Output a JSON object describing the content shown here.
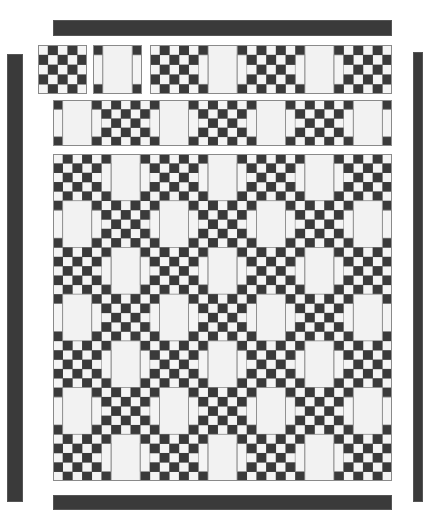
{
  "diagram": {
    "title": "",
    "type": "quilt-layout",
    "colors": {
      "dark": "#3a3a3a",
      "light": "#f4f4f4",
      "center": "#f2f2f2",
      "outline": "#8a8a8a",
      "background": "#ffffff"
    },
    "block_types": {
      "C": "checkerboard 5x5 nine-patch block",
      "A": "alternate block: dark corners, light side strips, plain light center"
    },
    "borders": [
      {
        "id": "top-border",
        "x": 53,
        "y": 20,
        "w": 339,
        "h": 16
      },
      {
        "id": "left-border",
        "x": 7,
        "y": 54,
        "w": 16,
        "h": 448
      },
      {
        "id": "right-border",
        "x": 413,
        "y": 52,
        "w": 10,
        "h": 450
      },
      {
        "id": "bottom-border",
        "x": 53,
        "y": 495,
        "w": 339,
        "h": 15
      }
    ],
    "pieces": [
      {
        "id": "single-checker-block",
        "x": 38,
        "y": 45,
        "w": 49,
        "h": 49,
        "blocks": [
          [
            "C"
          ]
        ],
        "parity": 0
      },
      {
        "id": "single-alternate-block",
        "x": 93,
        "y": 45,
        "w": 49,
        "h": 49,
        "blocks": [
          [
            "A"
          ]
        ],
        "parity": 0
      },
      {
        "id": "five-block-row",
        "x": 150,
        "y": 45,
        "w": 242,
        "h": 49,
        "blocks": [
          [
            "C",
            "A",
            "C",
            "A",
            "C"
          ]
        ],
        "parity": 0
      },
      {
        "id": "seven-block-row",
        "x": 53,
        "y": 100,
        "w": 339,
        "h": 46,
        "blocks": [
          [
            "A",
            "C",
            "A",
            "C",
            "A",
            "C",
            "A"
          ]
        ],
        "parity": 1
      },
      {
        "id": "assembled-quilt-center",
        "x": 53,
        "y": 154,
        "w": 339,
        "h": 327,
        "blocks": [
          [
            "C",
            "A",
            "C",
            "A",
            "C",
            "A",
            "C"
          ],
          [
            "A",
            "C",
            "A",
            "C",
            "A",
            "C",
            "A"
          ],
          [
            "C",
            "A",
            "C",
            "A",
            "C",
            "A",
            "C"
          ],
          [
            "A",
            "C",
            "A",
            "C",
            "A",
            "C",
            "A"
          ],
          [
            "C",
            "A",
            "C",
            "A",
            "C",
            "A",
            "C"
          ],
          [
            "A",
            "C",
            "A",
            "C",
            "A",
            "C",
            "A"
          ],
          [
            "C",
            "A",
            "C",
            "A",
            "C",
            "A",
            "C"
          ]
        ],
        "parity": 0
      }
    ]
  }
}
